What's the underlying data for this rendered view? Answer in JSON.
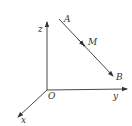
{
  "diagram": {
    "type": "3d-coordinate-system",
    "colors": {
      "stroke": "#333333",
      "background": "#ffffff"
    },
    "origin": {
      "label": "O"
    },
    "axes": {
      "x": {
        "label": "x"
      },
      "y": {
        "label": "y"
      },
      "z": {
        "label": "z"
      }
    },
    "segment": {
      "start_label": "A",
      "end_label": "B",
      "midpoint_label": "M"
    }
  }
}
